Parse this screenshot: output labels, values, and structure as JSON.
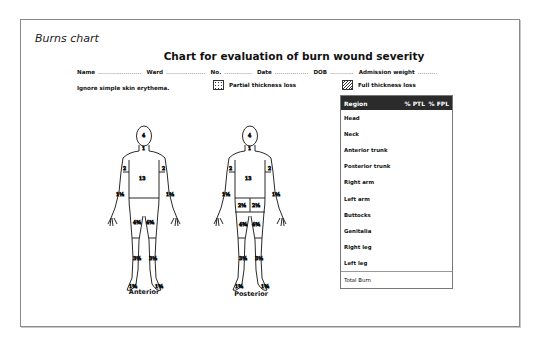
{
  "caption": "Burns chart",
  "title": "Chart for evaluation of burn wound severity",
  "fields": [
    {
      "label": "Name",
      "dots": "......................"
    },
    {
      "label": "Ward",
      "dots": "...................."
    },
    {
      "label": "No.",
      "dots": ".............."
    },
    {
      "label": "Date",
      "dots": "................."
    },
    {
      "label": "DOB",
      "dots": "............"
    },
    {
      "label": "Admission weight",
      "dots": ".........."
    }
  ],
  "note": "Ignore simple skin erythema.",
  "legend": {
    "partial": "Partial thickness loss",
    "full": "Full thickness loss"
  },
  "table": {
    "headers": [
      "Region",
      "% PTL",
      "% FPL"
    ],
    "rows": [
      "Head",
      "Neck",
      "Anterior trunk",
      "Posterior trunk",
      "Right arm",
      "Left arm",
      "Buttocks",
      "Genitalia",
      "Right leg",
      "Left leg"
    ],
    "total": "Total Burn"
  },
  "figures": {
    "anterior": {
      "label": "Anterior",
      "values": {
        "head": "4",
        "neck": "1",
        "trunk": "13",
        "upper_arm_r": "2",
        "upper_arm_l": "2",
        "forearm_r": "1½",
        "forearm_l": "1½",
        "thigh_r": "4¾",
        "thigh_l": "4¾",
        "leg_r": "3½",
        "leg_l": "3½",
        "foot_r": "1¾",
        "foot_l": "1¾"
      }
    },
    "posterior": {
      "label": "Posterior",
      "values": {
        "head": "4",
        "neck": "1",
        "trunk": "13",
        "upper_arm_r": "2",
        "upper_arm_l": "2",
        "forearm_r": "1½",
        "forearm_l": "1½",
        "buttock_r": "2½",
        "buttock_l": "2½",
        "thigh_r": "4¾",
        "thigh_l": "4¾",
        "leg_r": "3½",
        "leg_l": "3½",
        "foot_r": "1¾",
        "foot_l": "1¾"
      }
    }
  }
}
